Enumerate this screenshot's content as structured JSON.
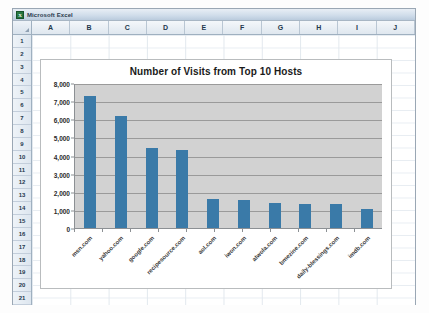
{
  "window": {
    "app_title": "Microsoft Excel",
    "icon": "excel-icon",
    "icon_glyph": "X"
  },
  "spreadsheet": {
    "column_headers": [
      "A",
      "B",
      "C",
      "D",
      "E",
      "F",
      "G",
      "H",
      "I",
      "J"
    ],
    "row_headers": [
      "1",
      "2",
      "3",
      "4",
      "5",
      "6",
      "7",
      "8",
      "9",
      "10",
      "11",
      "12",
      "13",
      "14",
      "15",
      "16",
      "17",
      "18",
      "19",
      "20",
      "21"
    ]
  },
  "chart_data": {
    "type": "bar",
    "title": "Number of Visits from Top 10 Hosts",
    "xlabel": "",
    "ylabel": "",
    "ylim": [
      0,
      8000
    ],
    "yticks": [
      0,
      1000,
      2000,
      3000,
      4000,
      5000,
      6000,
      7000,
      8000
    ],
    "ytick_labels": [
      "0",
      "1,000",
      "2,000",
      "3,000",
      "4,000",
      "5,000",
      "6,000",
      "7,000",
      "8,000"
    ],
    "grid": true,
    "legend": false,
    "categories": [
      "msn.com",
      "yahoo.com",
      "google.com",
      "recipesource.com",
      "aol.com",
      "iwon.com",
      "atwola.com",
      "bmezine.com",
      "daily-blessings.com",
      "imdb.com"
    ],
    "values": [
      7300,
      6200,
      4400,
      4300,
      1600,
      1550,
      1400,
      1350,
      1300,
      1050
    ],
    "series_color": "#3a7aa8",
    "plot_background": "#d2d2d2",
    "chart_background": "#ffffff"
  }
}
